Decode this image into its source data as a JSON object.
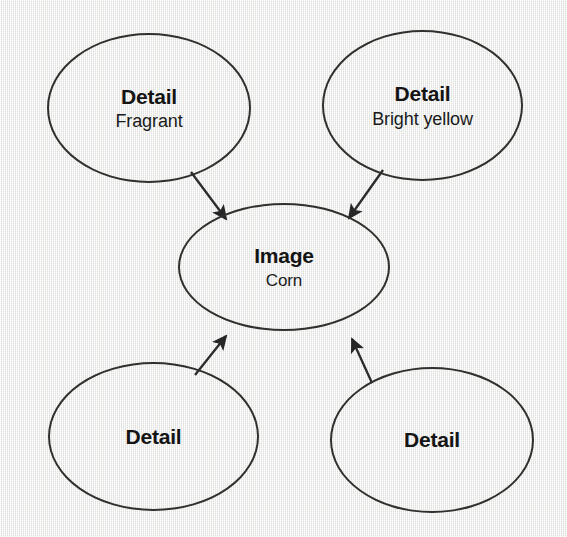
{
  "diagram": {
    "type": "concept-map",
    "background_color": "#f1f1f0",
    "stroke_color": "#30302f",
    "text_color": "#141414",
    "nodes": [
      {
        "id": "detail-fragrant",
        "title": "Detail",
        "subtitle": "Fragrant",
        "shape": "ellipse",
        "position": "top-left"
      },
      {
        "id": "detail-bright-yellow",
        "title": "Detail",
        "subtitle": "Bright yellow",
        "shape": "ellipse",
        "position": "top-right"
      },
      {
        "id": "image-corn",
        "title": "Image",
        "subtitle": "Corn",
        "shape": "ellipse",
        "position": "center"
      },
      {
        "id": "detail-bottom-left",
        "title": "Detail",
        "subtitle": "",
        "shape": "ellipse",
        "position": "bottom-left"
      },
      {
        "id": "detail-bottom-right",
        "title": "Detail",
        "subtitle": "",
        "shape": "ellipse",
        "position": "bottom-right"
      }
    ],
    "edges": [
      {
        "id": "edge-fragrant-to-image",
        "from": "detail-fragrant",
        "to": "image-corn",
        "arrowhead": "end"
      },
      {
        "id": "edge-bright-to-image",
        "from": "detail-bright-yellow",
        "to": "image-corn",
        "arrowhead": "end"
      },
      {
        "id": "edge-bottomleft-to-image",
        "from": "detail-bottom-left",
        "to": "image-corn",
        "arrowhead": "end"
      },
      {
        "id": "edge-bottomright-to-image",
        "from": "detail-bottom-right",
        "to": "image-corn",
        "arrowhead": "end"
      }
    ]
  }
}
